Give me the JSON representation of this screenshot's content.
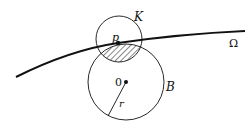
{
  "diagram": {
    "labels": {
      "small_circle": "K",
      "point_on_curve": "p",
      "curve": "Ω",
      "center": "0",
      "big_circle": "B",
      "radius": "r"
    },
    "colors": {
      "stroke": "#111111",
      "background": "#ffffff"
    },
    "elements": {
      "curve": {
        "name": "Ω",
        "from": [
          16,
          77
        ],
        "through": [
          118,
          43
        ],
        "to": [
          245,
          31
        ]
      },
      "circle_K": {
        "cx": 119,
        "cy": 39,
        "r": 23
      },
      "circle_B": {
        "cx": 126,
        "cy": 82,
        "r": 38
      },
      "point_p": {
        "x": 118,
        "y": 43
      },
      "point_0": {
        "x": 126,
        "y": 82
      },
      "radius_line": {
        "from": [
          126,
          82
        ],
        "to": [
          108,
          116
        ]
      },
      "hatched_region": "intersection of K and B below curve Ω"
    }
  }
}
